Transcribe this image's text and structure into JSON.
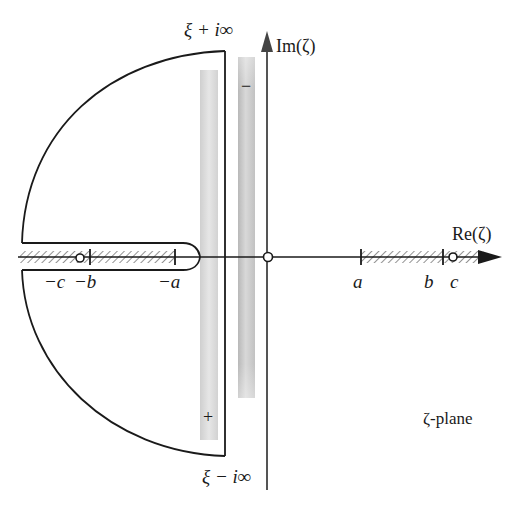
{
  "diagram": {
    "plane_label": "ζ-plane",
    "axes": {
      "imaginary_label": "Im(ζ)",
      "real_label": "Re(ζ)"
    },
    "contour": {
      "top_label": "ξ + i∞",
      "bottom_label": "ξ − i∞"
    },
    "strips": [
      {
        "id": "plus-strip",
        "sign": "+",
        "shade": "#dcdcdc"
      },
      {
        "id": "minus-strip",
        "sign": "−",
        "shade": "#c8c8c8"
      }
    ],
    "branch_points": {
      "right": [
        {
          "label": "a",
          "kind": "tick"
        },
        {
          "label": "b",
          "kind": "tick"
        },
        {
          "label": "c",
          "kind": "pole"
        }
      ],
      "left": [
        {
          "label": "−c",
          "kind": "pole"
        },
        {
          "label": "−b",
          "kind": "tick"
        },
        {
          "label": "−a",
          "kind": "tick"
        }
      ]
    },
    "origin_marker": "pole",
    "colors": {
      "line": "#1a1a1a",
      "axis": "#555555",
      "hatch": "#777777"
    }
  },
  "caption_fragment": "...................................."
}
